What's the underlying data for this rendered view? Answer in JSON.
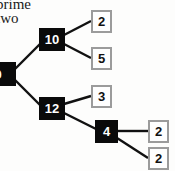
{
  "diagram": {
    "type": "factor-tree",
    "title_fragments": {
      "line1": "prime",
      "line2": "two"
    },
    "background_color": "#fdfdfc",
    "composite_node_color": "#0a0a0a",
    "composite_text_color": "#ffffff",
    "prime_node_color": "#fefefe",
    "prime_border_color": "#9b9b9b",
    "prime_text_color": "#111111",
    "edge_color": "#111111",
    "nodes": [
      {
        "id": "root",
        "label": "120",
        "kind": "composite",
        "x": -16,
        "y": 62,
        "w": 32,
        "h": 24,
        "clipped": true
      },
      {
        "id": "n10",
        "label": "10",
        "kind": "composite",
        "x": 39,
        "y": 28,
        "w": 26,
        "h": 23,
        "clipped": false
      },
      {
        "id": "n12",
        "label": "12",
        "kind": "composite",
        "x": 39,
        "y": 97,
        "w": 26,
        "h": 23,
        "clipped": false
      },
      {
        "id": "n4",
        "label": "4",
        "kind": "composite",
        "x": 95,
        "y": 120,
        "w": 23,
        "h": 23,
        "clipped": false
      },
      {
        "id": "p2a",
        "label": "2",
        "kind": "prime",
        "x": 91,
        "y": 10,
        "w": 21,
        "h": 23,
        "clipped": false
      },
      {
        "id": "p5",
        "label": "5",
        "kind": "prime",
        "x": 91,
        "y": 47,
        "w": 21,
        "h": 23,
        "clipped": false
      },
      {
        "id": "p3",
        "label": "3",
        "kind": "prime",
        "x": 91,
        "y": 85,
        "w": 21,
        "h": 23,
        "clipped": false
      },
      {
        "id": "p2b",
        "label": "2",
        "kind": "prime",
        "x": 148,
        "y": 120,
        "w": 21,
        "h": 23,
        "clipped": false
      },
      {
        "id": "p2c",
        "label": "2",
        "kind": "prime",
        "x": 148,
        "y": 147,
        "w": 21,
        "h": 23,
        "clipped": false
      }
    ],
    "edges": [
      {
        "from": "root",
        "to": "n10",
        "x1": 14,
        "y1": 70,
        "x2": 40,
        "y2": 44
      },
      {
        "from": "root",
        "to": "n12",
        "x1": 14,
        "y1": 79,
        "x2": 40,
        "y2": 105
      },
      {
        "from": "n10",
        "to": "p2a",
        "x1": 64,
        "y1": 35,
        "x2": 91,
        "y2": 21
      },
      {
        "from": "n10",
        "to": "p5",
        "x1": 64,
        "y1": 44,
        "x2": 91,
        "y2": 58
      },
      {
        "from": "n12",
        "to": "p3",
        "x1": 64,
        "y1": 104,
        "x2": 91,
        "y2": 96
      },
      {
        "from": "n12",
        "to": "n4",
        "x1": 64,
        "y1": 113,
        "x2": 96,
        "y2": 129
      },
      {
        "from": "n4",
        "to": "p2b",
        "x1": 117,
        "y1": 131,
        "x2": 148,
        "y2": 131
      },
      {
        "from": "n4",
        "to": "p2c",
        "x1": 117,
        "y1": 138,
        "x2": 148,
        "y2": 158
      }
    ]
  }
}
